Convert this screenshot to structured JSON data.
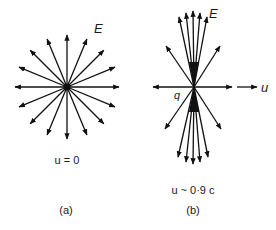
{
  "figure": {
    "panel_a": {
      "caption": "(a)",
      "condition": "u = 0",
      "field_label": "E",
      "center": [
        67,
        87
      ],
      "arrow_count": 16,
      "arrow_length": 52
    },
    "panel_b": {
      "caption": "(b)",
      "condition": "u ~ 0·9 c",
      "field_label": "E",
      "charge_label": "q",
      "velocity_label": "u",
      "center": [
        194,
        87
      ]
    },
    "colors": {
      "stroke": "#111111",
      "background": "#ffffff"
    }
  }
}
